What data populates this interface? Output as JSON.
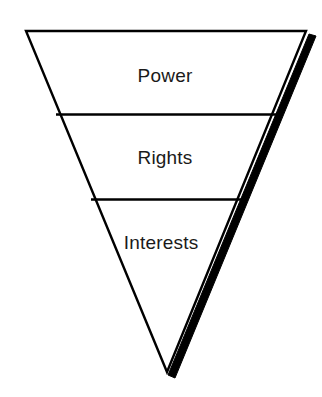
{
  "diagram": {
    "type": "inverted-triangle-hierarchy",
    "title": "",
    "orientation": "inverted",
    "shape": {
      "outline_color": "#000000",
      "fill_color": "#ffffff",
      "outline_width_px": 2,
      "shadow_color": "#000000",
      "shadow_width_px": 9,
      "vertices": {
        "top_left": {
          "x": 26,
          "y": 31
        },
        "top_right": {
          "x": 306,
          "y": 31
        },
        "bottom_apex": {
          "x": 167,
          "y": 372
        }
      },
      "dividers": [
        {
          "y": 115,
          "x_left": 57,
          "x_right": 280
        },
        {
          "y": 200,
          "x_left": 92,
          "x_right": 245
        }
      ]
    },
    "tiers": [
      {
        "id": "tier-power",
        "label": "Power",
        "order": 1,
        "position": "top",
        "center": {
          "x": 165,
          "y": 76
        },
        "band_top_y": 31,
        "band_bottom_y": 115
      },
      {
        "id": "tier-rights",
        "label": "Rights",
        "order": 2,
        "position": "middle",
        "center": {
          "x": 165,
          "y": 158
        },
        "band_top_y": 115,
        "band_bottom_y": 200
      },
      {
        "id": "tier-interests",
        "label": "Interests",
        "order": 3,
        "position": "bottom",
        "center": {
          "x": 161,
          "y": 243
        },
        "band_top_y": 200,
        "band_bottom_y": 372
      }
    ]
  },
  "colors": {
    "background": "#ffffff",
    "stroke": "#000000",
    "shadow": "#000000",
    "text": "#1a1a1a"
  }
}
